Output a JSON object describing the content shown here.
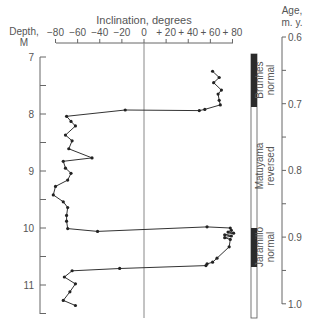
{
  "chart_data": {
    "type": "line",
    "title": "",
    "xlabel": "Inclination, degrees",
    "ylabel_left": "Depth, M",
    "ylabel_right": "Age, m. y.",
    "x_ticks": [
      "−80",
      "−60",
      "−40",
      "−20",
      "0",
      "+ 20",
      "+ 40",
      "+ 60",
      "+ 80"
    ],
    "x_tick_values": [
      -80,
      -60,
      -40,
      -20,
      0,
      20,
      40,
      60,
      80
    ],
    "depth_ticks": [
      "7",
      "8",
      "9",
      "10",
      "11"
    ],
    "depth_tick_values": [
      7,
      8,
      9,
      10,
      11
    ],
    "age_ticks": [
      "0.6",
      "0.7",
      "0.8",
      "0.9",
      "1.0"
    ],
    "age_tick_values": [
      0.6,
      0.7,
      0.8,
      0.9,
      1.0
    ],
    "xlim": [
      -80,
      80
    ],
    "depth_range": [
      7,
      11.5
    ],
    "age_range": [
      0.6,
      1.0
    ],
    "grid": false,
    "series": [
      {
        "name": "Inclination vs depth",
        "points": [
          {
            "inclination": 62,
            "depth": 7.25
          },
          {
            "inclination": 68,
            "depth": 7.36
          },
          {
            "inclination": 63,
            "depth": 7.45
          },
          {
            "inclination": 70,
            "depth": 7.58
          },
          {
            "inclination": 67,
            "depth": 7.65
          },
          {
            "inclination": 68,
            "depth": 7.76
          },
          {
            "inclination": 69,
            "depth": 7.84
          },
          {
            "inclination": 55,
            "depth": 7.92
          },
          {
            "inclination": 50,
            "depth": 7.94
          },
          {
            "inclination": -17,
            "depth": 7.93
          },
          {
            "inclination": -70,
            "depth": 8.04
          },
          {
            "inclination": -66,
            "depth": 8.13
          },
          {
            "inclination": -62,
            "depth": 8.21
          },
          {
            "inclination": -71,
            "depth": 8.37
          },
          {
            "inclination": -65,
            "depth": 8.47
          },
          {
            "inclination": -68,
            "depth": 8.61
          },
          {
            "inclination": -47,
            "depth": 8.77
          },
          {
            "inclination": -73,
            "depth": 8.83
          },
          {
            "inclination": -71,
            "depth": 8.95
          },
          {
            "inclination": -66,
            "depth": 9.04
          },
          {
            "inclination": -69,
            "depth": 9.16
          },
          {
            "inclination": -80,
            "depth": 9.27
          },
          {
            "inclination": -82,
            "depth": 9.42
          },
          {
            "inclination": -73,
            "depth": 9.54
          },
          {
            "inclination": -69,
            "depth": 9.64
          },
          {
            "inclination": -70,
            "depth": 9.78
          },
          {
            "inclination": -70,
            "depth": 9.88
          },
          {
            "inclination": -69,
            "depth": 10.01
          },
          {
            "inclination": -42,
            "depth": 10.06
          },
          {
            "inclination": 57,
            "depth": 9.98
          },
          {
            "inclination": 78,
            "depth": 10.0
          },
          {
            "inclination": 79,
            "depth": 10.04
          },
          {
            "inclination": 76,
            "depth": 10.07
          },
          {
            "inclination": 81,
            "depth": 10.09
          },
          {
            "inclination": 73,
            "depth": 10.12
          },
          {
            "inclination": 79,
            "depth": 10.14
          },
          {
            "inclination": 73,
            "depth": 10.17
          },
          {
            "inclination": 78,
            "depth": 10.2
          },
          {
            "inclination": 77,
            "depth": 10.33
          },
          {
            "inclination": 66,
            "depth": 10.53
          },
          {
            "inclination": 62,
            "depth": 10.6
          },
          {
            "inclination": 57,
            "depth": 10.63
          },
          {
            "inclination": 56,
            "depth": 10.66
          },
          {
            "inclination": -22,
            "depth": 10.71
          },
          {
            "inclination": -65,
            "depth": 10.75
          },
          {
            "inclination": -72,
            "depth": 10.86
          },
          {
            "inclination": -62,
            "depth": 10.98
          },
          {
            "inclination": -67,
            "depth": 11.12
          },
          {
            "inclination": -73,
            "depth": 11.27
          },
          {
            "inclination": -62,
            "depth": 11.36
          }
        ]
      }
    ],
    "polarity_zones": [
      {
        "name": "Brunhes normal",
        "polarity": "normal",
        "depth_from": 7.0,
        "depth_to": 7.93
      },
      {
        "name": "Matuyama reversed",
        "polarity": "reversed",
        "depth_from": 7.93,
        "depth_to": 10.0
      },
      {
        "name": "Jaramillo normal",
        "polarity": "normal",
        "depth_from": 10.0,
        "depth_to": 10.7
      }
    ],
    "annotations": [
      "Brunhes normal",
      "Matuyama reversed",
      "Jaramillo normal"
    ]
  },
  "labels": {
    "x_title": "Inclination, degrees",
    "depth_title_1": "Depth,",
    "depth_title_2": "M",
    "age_title_1": "Age,",
    "age_title_2": "m. y.",
    "zone1_l1": "Brunhes",
    "zone1_l2": "normal",
    "zone2_l1": "Matuyama",
    "zone2_l2": "reversed",
    "zone3_l1": "Jaramillo",
    "zone3_l2": "normal"
  },
  "colors": {
    "line": "#333333",
    "axis": "#666666",
    "normal_bar": "#2b2b2b",
    "reversed_bar": "#ffffff"
  }
}
